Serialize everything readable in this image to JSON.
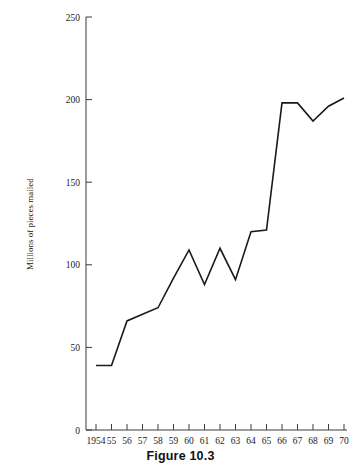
{
  "figure": {
    "caption": "Figure 10.3"
  },
  "chart_data": {
    "type": "line",
    "title": "",
    "subtitle": "",
    "xlabel": "",
    "ylabel": "Millions of pieces mailed",
    "x": [
      1954,
      1955,
      1956,
      1957,
      1958,
      1959,
      1960,
      1961,
      1962,
      1963,
      1964,
      1965,
      1966,
      1967,
      1968,
      1969,
      1970
    ],
    "xtick_labels": [
      "1954",
      "55",
      "56",
      "57",
      "58",
      "59",
      "60",
      "61",
      "62",
      "63",
      "64",
      "65",
      "66",
      "67",
      "68",
      "69",
      "70"
    ],
    "values": [
      39,
      39,
      66,
      70,
      74,
      92,
      109,
      88,
      110,
      91,
      120,
      121,
      198,
      198,
      187,
      196,
      201
    ],
    "ytick_labels": [
      "0",
      "50",
      "100",
      "150",
      "200",
      "250"
    ],
    "yticks": [
      0,
      50,
      100,
      150,
      200,
      250
    ],
    "ylim": [
      0,
      250
    ],
    "xlim": [
      1954,
      1970
    ],
    "grid": false,
    "legend": false,
    "series": [
      {
        "name": "Millions of pieces mailed",
        "values": [
          39,
          39,
          66,
          70,
          74,
          92,
          109,
          88,
          110,
          91,
          120,
          121,
          198,
          198,
          187,
          196,
          201
        ],
        "color": "#1a1a1a"
      }
    ],
    "line_color": "#1a1a1a",
    "axis_color": "#3a3a3a",
    "background_color": "#ffffff"
  }
}
